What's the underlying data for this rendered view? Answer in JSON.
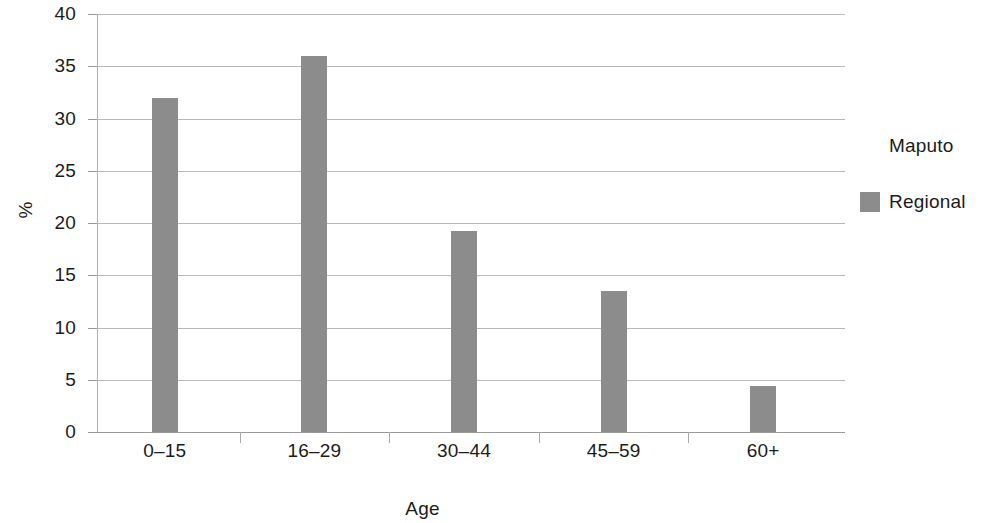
{
  "chart_data": {
    "type": "bar",
    "title": "",
    "xlabel": "Age",
    "ylabel": "%",
    "categories": [
      "0–15",
      "16–29",
      "30–44",
      "45–59",
      "60+"
    ],
    "series": [
      {
        "name": "Maputo",
        "color": "#ffffff",
        "values": [
          null,
          null,
          null,
          null,
          null
        ]
      },
      {
        "name": "Regional",
        "color": "#8c8c8c",
        "values": [
          32,
          36,
          19.2,
          13.5,
          4.4
        ]
      }
    ],
    "ylim": [
      0,
      40
    ],
    "yticks": [
      0,
      5,
      10,
      15,
      20,
      25,
      30,
      35,
      40
    ],
    "ytick_labels": [
      "0",
      "5",
      "10",
      "15",
      "20",
      "25",
      "30",
      "35",
      "40"
    ],
    "grid": true,
    "grid_axis": "y",
    "legend_position": "right",
    "legend_entries": [
      "Maputo",
      "Regional"
    ]
  },
  "axes": {
    "y_title": "%",
    "x_title": "Age"
  },
  "legend": {
    "items": [
      {
        "label": "Maputo",
        "swatch": "#ffffff"
      },
      {
        "label": "Regional",
        "swatch": "#8c8c8c"
      }
    ]
  },
  "colors": {
    "bar": "#8c8c8c",
    "grid": "#b9b9b9",
    "axis": "#a8a8a8",
    "text": "#1c1c1c",
    "background": "#ffffff"
  }
}
